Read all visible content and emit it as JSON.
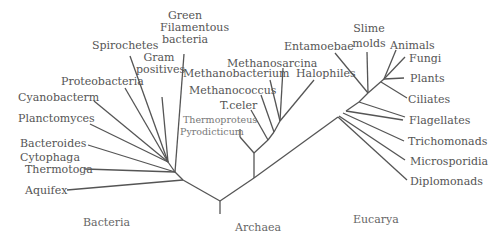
{
  "domains": {
    "bacteria": "Bacteria",
    "archaea": "Archaea",
    "eucarya": "Eucarya"
  },
  "bacteria": {
    "green": [
      "Green",
      "Filamentous",
      "bacteria"
    ],
    "spirochetes": "Spirochetes",
    "gram": [
      "Gram",
      "positives"
    ],
    "proteobacteria": "Proteobacteria",
    "cyanobacteria": "Cyanobacterm",
    "planctomyces": "Planctomyces",
    "bacteroides": [
      "Bacteroides",
      "Cytophaga"
    ],
    "thermotoga": "Thermotoga",
    "aquifex": "Aquifex"
  },
  "archaea": {
    "methanosarcina": "Methanosarcina",
    "methanobacterium": "Methanobacterium",
    "halophiles": "Halophiles",
    "methanococcus": "Methanococcus",
    "tceler": "T.celer",
    "thermoproteus": "Thermoproteus",
    "pyrodicticum": "Pyrodicticum"
  },
  "eucarya": {
    "entamoebae": "Entamoebae",
    "slime": [
      "Slime",
      "molds"
    ],
    "animals": "Animals",
    "fungi": "Fungi",
    "plants": "Plants",
    "ciliates": "Ciliates",
    "flagellates": "Flagellates",
    "trichomonads": "Trichomonads",
    "microsporidia": "Microsporidia",
    "diplomonads": "Diplomonads"
  }
}
